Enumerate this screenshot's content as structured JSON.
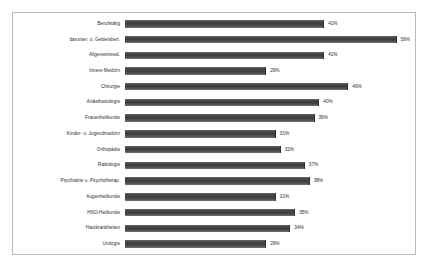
{
  "chart_data": {
    "type": "bar",
    "orientation": "horizontal",
    "title": "",
    "xlabel": "",
    "ylabel": "",
    "xlim": [
      0,
      60
    ],
    "grid": false,
    "legend": false,
    "value_suffix": "%",
    "categories": [
      "Berufstätig",
      "darunter: o. Gebietsbez.",
      "Allgemeinmed.",
      "Innere Medizin",
      "Chirurgie",
      "Anästhesiologie",
      "Frauenheilkunde",
      "Kinder- u. Jugendmedizin",
      "Orthopädie",
      "Radiologie",
      "Psychiatrie u. Psychotherap.",
      "Augenheilkunde",
      "HNO-Heilkunde",
      "Hautkrankheiten",
      "Urologie"
    ],
    "values": [
      41,
      56,
      41,
      29,
      46,
      40,
      39,
      31,
      32,
      37,
      38,
      31,
      35,
      34,
      29
    ],
    "value_labels": [
      "41%",
      "56%",
      "41%",
      "29%",
      "46%",
      "40%",
      "39%",
      "31%",
      "32%",
      "37%",
      "38%",
      "31%",
      "35%",
      "34%",
      "29%"
    ],
    "bar_color": "#4a4a4a",
    "frame_color": "#b9b9b9",
    "background_color": "#ffffff"
  }
}
